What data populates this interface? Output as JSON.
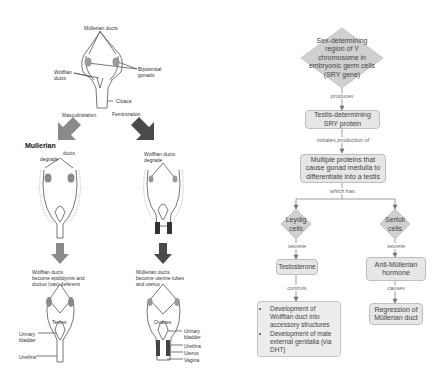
{
  "left_panel": {
    "top": {
      "mullerian_ducts": "Müllerian ducts",
      "bipotential_gonads_l1": "Bipotential",
      "bipotential_gonads_l2": "gonads",
      "wolffian_ducts_l1": "Wolffian",
      "wolffian_ducts_l2": "ducts",
      "cloaca": "Cloaca",
      "masculinization": "Masculinization",
      "feminization": "Feminization"
    },
    "middle_left": {
      "title": "Mullerian",
      "ducts": "ducts",
      "degrade": "degrade"
    },
    "middle_right": {
      "line1": "Wolffian ducts",
      "line2": "degrade"
    },
    "bottom_left": {
      "caption_l1": "Wolffian ducts",
      "caption_l2": "become epididymis and",
      "caption_l3": "ductus (vas) deferens",
      "testes": "Testes",
      "urinary_bladder_l1": "Urinary",
      "urinary_bladder_l2": "bladder",
      "urethra": "Urethra"
    },
    "bottom_right": {
      "caption_l1": "Müllerian ducts",
      "caption_l2": "become uterine tubes",
      "caption_l3": "and uterus",
      "ovaries": "Ovaries",
      "urinary_bladder_l1": "Urinary",
      "urinary_bladder_l2": "bladder",
      "urethra": "Urethra",
      "uterus": "Uterus",
      "vagina": "Vagina"
    },
    "colors": {
      "arrow_left": "#8a8a8a",
      "arrow_right": "#4a4a4a",
      "gonad": "#9a9a9a"
    }
  },
  "flowchart": {
    "root": "Sex-determining region of Y chromosome in embryonic germ cells (SRY gene)",
    "edge1": "produces",
    "node2": "Testis-determining SRY protein",
    "edge2": "initiates production of",
    "node3": "Multiple proteins that cause gonad medulla to differentiate into a testis",
    "edge3": "which has:",
    "leydig": "Leydig cells",
    "sertoli": "Sertoli cells",
    "leydig_edge": "secrete",
    "sertoli_edge": "secrete",
    "testosterone": "Testosterone",
    "amh": "Anti-Müllerian hormone",
    "testosterone_edge": "controls",
    "amh_edge": "causes",
    "testosterone_effects": [
      "Development of Wolffian duct into accessory structures",
      "Development of male external genitalia (via DHT)"
    ],
    "amh_effect": "Regression of Müllerian duct",
    "colors": {
      "node_fill": "#e6e6e6",
      "diamond_fill": "#d0d0d0",
      "border": "#bdbdbd",
      "line": "#777777"
    }
  }
}
